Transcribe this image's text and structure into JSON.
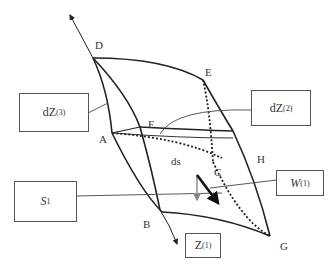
{
  "diagram": {
    "type": "surface-element-with-stress-vectors",
    "points": {
      "A": "A",
      "B": "B",
      "C": "C",
      "D": "D",
      "E": "E",
      "F": "F",
      "G": "G",
      "H": "H"
    },
    "center_label": "ds",
    "boxes": {
      "dz3": {
        "base": "dZ",
        "sup": "(3)"
      },
      "dz2": {
        "base": "dZ",
        "sup": "(2)"
      },
      "s1": {
        "base": "S",
        "sub": "1"
      },
      "w1": {
        "base": "W",
        "sup": "(1)"
      },
      "z1": {
        "base": "Z",
        "sup": "(1)"
      }
    },
    "colors": {
      "line": "#222222",
      "leader": "#444444",
      "normal_arrow": "#888888",
      "stress_arrow": "#111111"
    }
  }
}
